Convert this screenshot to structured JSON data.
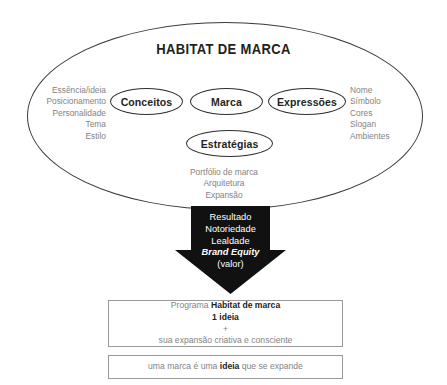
{
  "diagram": {
    "title": "HABITAT DE MARCA",
    "nodes": {
      "conceitos": "Conceitos",
      "marca": "Marca",
      "expressoes": "Expressões",
      "estrategias": "Estratégias"
    },
    "attributes": {
      "left": "Essência/ideia\nPosicionamento\nPersonalidade\nTema\nEstilo",
      "right": "Nome\nSímbolo\nCores\nSlogan\nAmbientes",
      "bottom": "Portfólio de marca\nArquitetura\nExpansão"
    },
    "arrow": {
      "line1": "Resultado",
      "line2": "Notoriedade",
      "line3": "Lealdade",
      "line4": "Brand Equity",
      "line5": "(valor)"
    },
    "program_box": {
      "line1_prefix": "Programa ",
      "line1_bold": "Habitat de marca",
      "line2_bold": "1 ideia",
      "line3": "+",
      "line4": "sua expansão criativa e consciente"
    },
    "claim_box": {
      "prefix": "uma marca é uma ",
      "bold": "ideia",
      "suffix": " que se expande"
    },
    "colors": {
      "ink": "#231f20",
      "muted": "#838383",
      "stroke": "#3a3a3a",
      "arrow_fill": "#111111",
      "box_border": "#9a9a9a"
    }
  }
}
